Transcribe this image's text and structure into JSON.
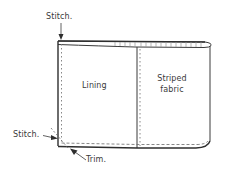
{
  "diagram": {
    "type": "sewing-instruction-illustration",
    "labels": {
      "stitch_top": "Stitch.",
      "stitch_bottom": "Stitch.",
      "trim": "Trim.",
      "lining": "Lining",
      "striped_fabric_line1": "Striped",
      "striped_fabric_line2": "fabric"
    },
    "panels": [
      {
        "name": "Lining"
      },
      {
        "name": "Striped fabric"
      }
    ],
    "colors": {
      "line": "#3a3a3a",
      "dotted": "#8a8a8a",
      "background": "#ffffff"
    }
  }
}
